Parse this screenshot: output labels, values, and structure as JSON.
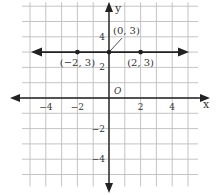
{
  "chart_data": {
    "type": "line",
    "title": "",
    "xlabel": "x",
    "ylabel": "y",
    "origin_label": "O",
    "xlim": [
      -5,
      5
    ],
    "ylim": [
      -5,
      6
    ],
    "grid": true,
    "x_ticks": [
      -4,
      -2,
      2,
      4
    ],
    "x_tick_labels": [
      "−4",
      "−2",
      "2",
      "4"
    ],
    "y_ticks": [
      4,
      2,
      -2,
      -4
    ],
    "y_tick_labels": [
      "4",
      "2",
      "−2",
      "−4"
    ],
    "series": [
      {
        "name": "y = 3",
        "kind": "horizontal-line",
        "y": 3,
        "arrows": "both",
        "points": [
          {
            "x": -2,
            "y": 3,
            "label": "(−2, 3)"
          },
          {
            "x": 0,
            "y": 3,
            "label": "(0, 3)"
          },
          {
            "x": 2,
            "y": 3,
            "label": "(2, 3)"
          }
        ]
      }
    ],
    "colors": {
      "axis": "#222222",
      "grid": "#bdbdbd",
      "line": "#222222",
      "text": "#333333"
    }
  }
}
